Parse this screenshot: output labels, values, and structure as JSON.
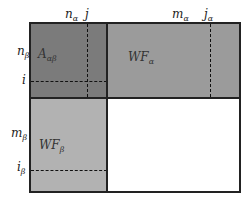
{
  "diagram": {
    "colors": {
      "A_block": "#7b7b7b",
      "WF_alpha_block": "#9b9b9b",
      "WF_beta_block": "#b2b2b2",
      "empty_block": "#ffffff",
      "border": "#222222"
    },
    "blocks": {
      "A": {
        "base": "A",
        "sub": "αβ"
      },
      "WF_alpha": {
        "base": "WF",
        "sub": "α"
      },
      "WF_beta": {
        "base": "WF",
        "sub": "β"
      }
    },
    "top_labels": {
      "n_alpha": {
        "base": "n",
        "sub": "α"
      },
      "j": {
        "base": "j"
      },
      "m_alpha": {
        "base": "m",
        "sub": "α"
      },
      "j_alpha": {
        "base": "j",
        "sub": "α"
      }
    },
    "left_labels": {
      "n_beta": {
        "base": "n",
        "sub": "β"
      },
      "i": {
        "base": "i"
      },
      "m_beta": {
        "base": "m",
        "sub": "β"
      },
      "i_beta": {
        "base": "i",
        "sub": "β"
      }
    }
  }
}
